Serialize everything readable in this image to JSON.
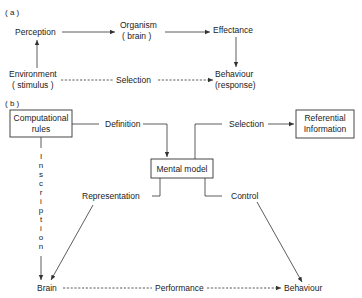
{
  "diagram": {
    "panel_a": {
      "label": "( a )",
      "nodes": {
        "perception": "Perception",
        "organism_line1": "Organism",
        "organism_line2": "( brain )",
        "effectance": "Effectance",
        "environment_line1": "Environment",
        "environment_line2": "( stimulus )",
        "behaviour_line1": "Behaviour",
        "behaviour_line2": "(response)"
      },
      "edges": {
        "selection": "Selection"
      }
    },
    "panel_b": {
      "label": "( b )",
      "nodes": {
        "computational_line1": "Computational",
        "computational_line2": "rules",
        "referential_line1": "Referential",
        "referential_line2": "Information",
        "mental_model": "Mental model",
        "brain": "Brain",
        "behaviour": "Behaviour"
      },
      "edges": {
        "definition": "Definition",
        "selection": "Selection",
        "representation": "Representation",
        "control": "Control",
        "performance": "Performance",
        "inscription_letters": [
          "I",
          "n",
          "s",
          "c",
          "r",
          "i",
          "p",
          "t",
          "i",
          "o",
          "n"
        ]
      }
    }
  }
}
